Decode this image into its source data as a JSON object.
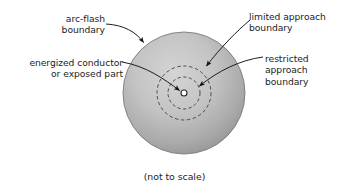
{
  "figure": {
    "title_caption": "(not to scale)",
    "labels": {
      "arc_flash": "arc-flash\nboundary",
      "energized": "energized conductor\nor exposed part",
      "limited": "limited approach\nboundary",
      "restricted": "restricted\napproach\nboundary"
    },
    "colors": {
      "shape_fill_outer": "#9d9d9d",
      "shape_fill_inner": "#c9c9c9",
      "outline": "#6b6b6b",
      "dashed_stroke": "#4d4d4d",
      "leader_line": "#1c1c1c",
      "text": "#1c1c1c",
      "background": "#ffffff",
      "center_dot_fill": "#ffffff"
    },
    "geometry": {
      "arc_flash_circle": {
        "cx": 184,
        "cy": 93,
        "r": 61
      },
      "limited_circle": {
        "cx": 184,
        "cy": 93,
        "r": 27
      },
      "restricted_circle": {
        "cx": 184,
        "cy": 93,
        "r": 16
      },
      "center_dot": {
        "cx": 184,
        "cy": 93,
        "r": 3
      }
    }
  }
}
